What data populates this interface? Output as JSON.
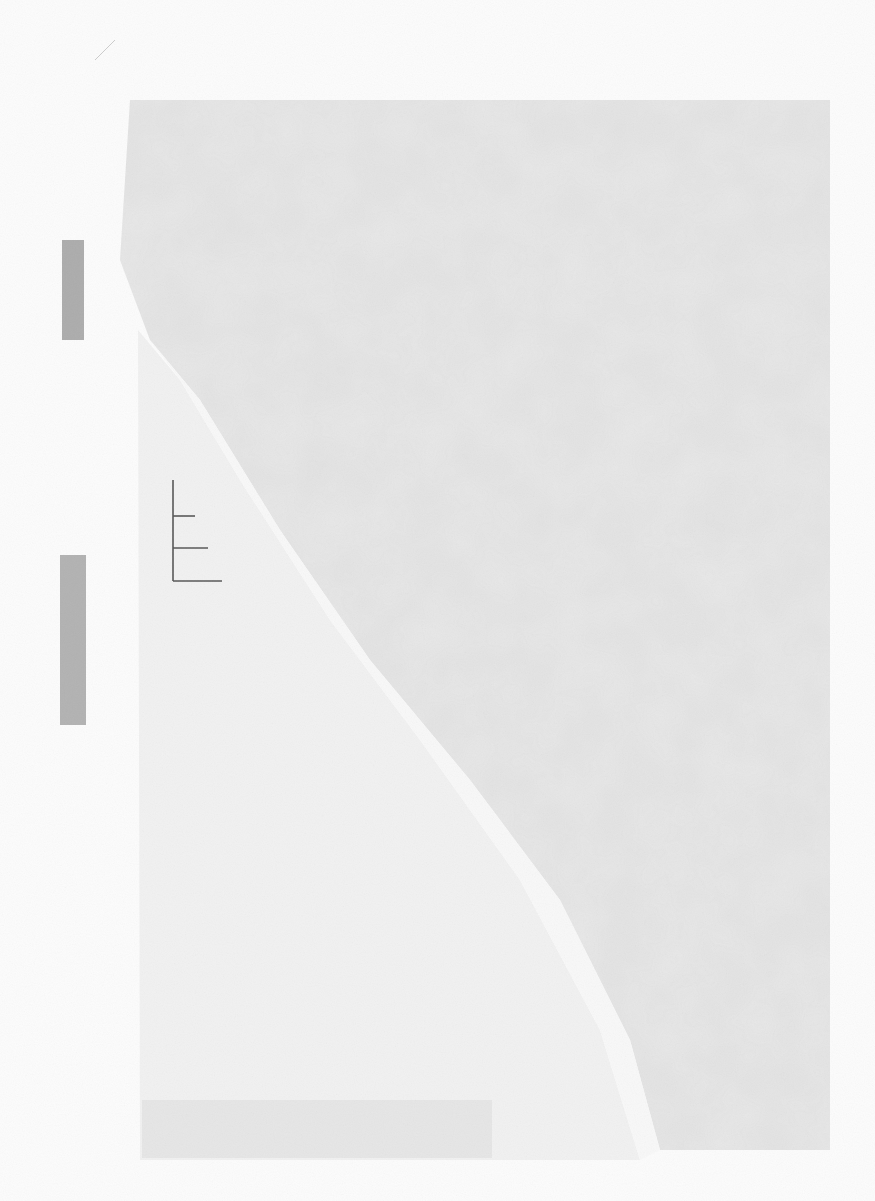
{
  "document": {
    "type": "scanned paper fragment",
    "visible_text": [],
    "colors": {
      "background": "#fcfcfc",
      "paper_upper": "#e9e9e9",
      "paper_lower": "#f1f1f1",
      "tear_strip": "#f8f8f8",
      "edge_marks": "#8a8a8a",
      "ruler_mark": "#555555"
    },
    "features": [
      "torn-diagonal-edge",
      "ruler-tick-mark",
      "left-edge-smudges",
      "bottom-texture-strip"
    ]
  }
}
